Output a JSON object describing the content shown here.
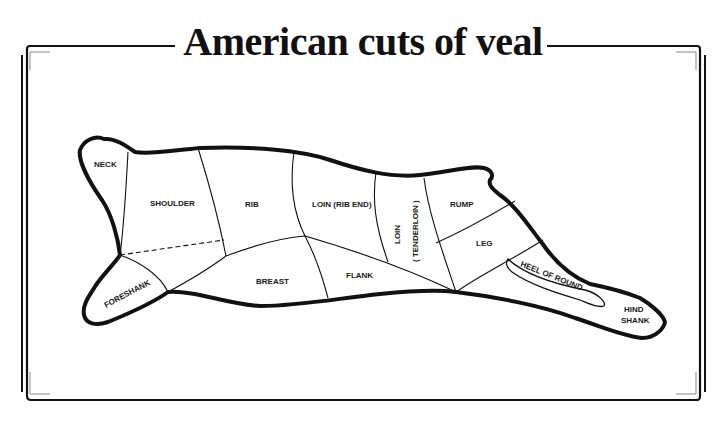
{
  "title": "American cuts of veal",
  "cuts": [
    {
      "id": "neck",
      "label": "NECK"
    },
    {
      "id": "shoulder",
      "label": "SHOULDER"
    },
    {
      "id": "rib",
      "label": "RIB"
    },
    {
      "id": "loin-rib-end",
      "label": "LOIN (RIB END)"
    },
    {
      "id": "loin-tenderloin",
      "label": "LOIN",
      "sub": "( TENDERLOIN )"
    },
    {
      "id": "rump",
      "label": "RUMP"
    },
    {
      "id": "leg",
      "label": "LEG"
    },
    {
      "id": "heel-of-round",
      "label": "HEEL OF ROUND"
    },
    {
      "id": "hind-shank",
      "label": "HIND",
      "sub": "SHANK"
    },
    {
      "id": "flank",
      "label": "FLANK"
    },
    {
      "id": "breast",
      "label": "BREAST"
    },
    {
      "id": "foreshank",
      "label": "FORESHANK"
    }
  ],
  "colors": {
    "ink": "#111111",
    "frame_inner": "#777777",
    "background": "#ffffff"
  }
}
